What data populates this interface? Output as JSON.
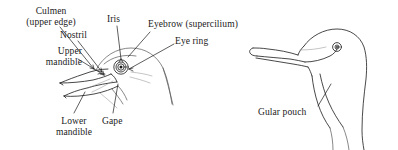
{
  "figure": {
    "background_color": "#ffffff",
    "ink_color": "#1a1a1a",
    "panels": [
      {
        "name": "labelled-bird-head",
        "description": "Side view of a bird head with open beak and labelled parts"
      },
      {
        "name": "gular-pouch-bird-head",
        "description": "Side view of a cormorant-like bird head showing the gular pouch"
      }
    ]
  },
  "labels": {
    "culmen": {
      "line1": "Culmen",
      "line2": "(upper edge)"
    },
    "nostril": {
      "line1": "Nostril"
    },
    "iris": {
      "line1": "Iris"
    },
    "eyebrow": {
      "line1": "Eyebrow (supercilium)"
    },
    "eye_ring": {
      "line1": "Eye ring"
    },
    "upper_mandible": {
      "line1": "Upper",
      "line2": "mandible"
    },
    "lower_mandible": {
      "line1": "Lower",
      "line2": "mandible"
    },
    "gape": {
      "line1": "Gape"
    },
    "gular_pouch": {
      "line1": "Gular pouch"
    }
  }
}
